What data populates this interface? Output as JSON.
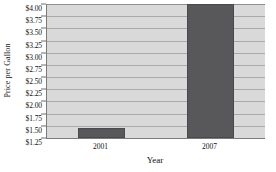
{
  "chart_data": {
    "type": "bar",
    "title": "",
    "xlabel": "Year",
    "ylabel": "Price per Gallon",
    "categories": [
      "2001",
      "2007"
    ],
    "values": [
      1.46,
      4.0
    ],
    "ylim": [
      1.25,
      4.0
    ],
    "ytick_step": 0.25,
    "ytick_labels": [
      "$4.00",
      "$3.75",
      "$3.50",
      "$3.25",
      "$3.00",
      "$2.75",
      "$2.50",
      "$2.25",
      "$2.00",
      "$1.75",
      "$1.50",
      "$1.25"
    ],
    "ytick_values": [
      4.0,
      3.75,
      3.5,
      3.25,
      3.0,
      2.75,
      2.5,
      2.25,
      2.0,
      1.75,
      1.5,
      1.25
    ],
    "grid": true,
    "legend": "none",
    "series": [
      {
        "name": "Price per Gallon",
        "values": [
          1.46,
          4.0
        ]
      }
    ],
    "colors": {
      "bar_fill": "#58585a",
      "bar_border": "#4a4a4c",
      "plot_background": "#d9d9d9",
      "gridline": "#a9a9a9",
      "axis": "#7a7a7a",
      "text": "#111111"
    }
  }
}
